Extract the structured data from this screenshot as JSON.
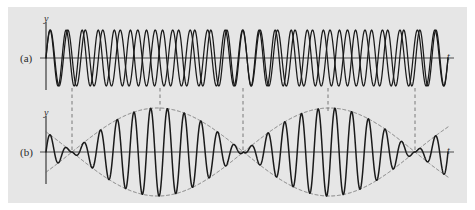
{
  "figure": {
    "name": "beats-waveform-figure",
    "background_color": "#e6e6e6",
    "page_color": "#ffffff",
    "curve_color": "#1a1a1a",
    "axis_color": "#4a4a4a",
    "dashed_color": "#6e6e6e",
    "panels": [
      {
        "id": "a",
        "label": "(a)",
        "y_axis_label": "y",
        "t_axis_label": "t"
      },
      {
        "id": "b",
        "label": "(b)",
        "y_axis_label": "y",
        "t_axis_label": "t"
      }
    ]
  },
  "chart_data": {
    "type": "line",
    "title": "",
    "subtitle": "",
    "xlabel": "t",
    "ylabel": "y",
    "grid": false,
    "legend_position": "none",
    "annotations": [
      {
        "text": "(a)",
        "role": "panel-label",
        "x": 20,
        "y": 58
      },
      {
        "text": "(b)",
        "role": "panel-label",
        "x": 20,
        "y": 152
      },
      {
        "text": "y",
        "role": "axis-label",
        "x": 46,
        "y": 22
      },
      {
        "text": "t",
        "role": "axis-label",
        "x": 450,
        "y": 58
      },
      {
        "text": "y",
        "role": "axis-label",
        "x": 46,
        "y": 116
      },
      {
        "text": "t",
        "role": "axis-label",
        "x": 450,
        "y": 152
      }
    ],
    "panels": [
      {
        "id": "a",
        "description": "Two sinusoidal waves of slightly different frequency drawn superimposed",
        "xlim": [
          46,
          448
        ],
        "ylim": [
          -1.15,
          1.15
        ],
        "axis_y_pixel": 58,
        "amplitude_pixels": 28,
        "series": [
          {
            "name": "wave-1",
            "amplitude": 1.0,
            "cycles": 25.0,
            "phase": 0.0
          },
          {
            "name": "wave-2",
            "amplitude": 1.0,
            "cycles": 23.0,
            "phase": 0.0
          }
        ]
      },
      {
        "id": "b",
        "description": "Superposition of the two waves showing beats, with dashed amplitude envelope",
        "xlim": [
          46,
          448
        ],
        "ylim": [
          -2.1,
          2.1
        ],
        "axis_y_pixel": 152,
        "amplitude_pixels": 44,
        "series": [
          {
            "name": "resultant-wave",
            "carrier_cycles": 24.0,
            "envelope_cycles": 1.0,
            "amplitude": 2.0
          },
          {
            "name": "envelope-upper",
            "style": "dashed",
            "amplitude": 2.0
          },
          {
            "name": "envelope-lower",
            "style": "dashed",
            "amplitude": -2.0
          }
        ],
        "beat_nodes_pixels": [
          72,
          243,
          415
        ],
        "beat_maxima_pixels": [
          160,
          328
        ]
      }
    ],
    "connector_lines": {
      "style": "dashed",
      "x_positions_pixels": [
        72,
        160,
        243,
        328,
        415
      ],
      "y_top_pixel": 88,
      "y_bottom_pixel": 120
    }
  }
}
